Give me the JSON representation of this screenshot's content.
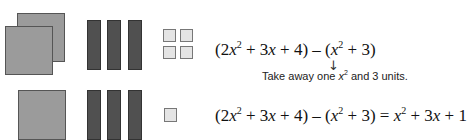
{
  "row1": {
    "x_squared_tiles": 2,
    "x_tiles": 3,
    "unit_tiles": 4,
    "expression": {
      "part1": "(2",
      "var1": "x",
      "exp1": "2",
      "part2": " + 3",
      "var2": "x",
      "part3": " + 4) – (",
      "var3": "x",
      "exp3": "2",
      "part4": " + 3)"
    },
    "arrow": "↓",
    "note": {
      "before": "Take away one ",
      "var": "x",
      "exp": "2",
      "after": " and 3 units."
    }
  },
  "row2": {
    "x_squared_tiles": 1,
    "x_tiles": 3,
    "unit_tiles": 1,
    "expression": {
      "part1": "(2",
      "var1": "x",
      "exp1": "2",
      "part2": " + 3",
      "var2": "x",
      "part3": " + 4) – (",
      "var3": "x",
      "exp3": "2",
      "part4": " + 3) = ",
      "var4": "x",
      "exp4": "2",
      "part5": " + 3",
      "var5": "x",
      "part6": " + 1"
    }
  },
  "colors": {
    "x_squared": "#9b9b9b",
    "x_bar": "#505050",
    "unit": "#e4e4e4"
  }
}
